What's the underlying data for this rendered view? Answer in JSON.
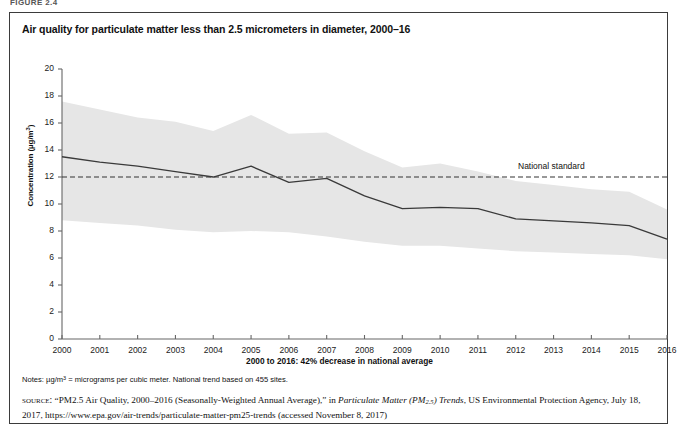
{
  "figure": {
    "label": "FIGURE 2.4",
    "title": "Air quality for particulate matter less than 2.5 micrometers in diameter, 2000–16"
  },
  "notes": {
    "text": "Notes: µg/m³ = micrograms per cubic meter. National trend based on 455 sites."
  },
  "source": {
    "kicker": "source:",
    "part1": "“PM2.5 Air Quality, 2000–2016 (Seasonally-Weighted Annual Average),” in ",
    "italic_title_a": "Particulate Matter (PM",
    "italic_title_sub": "2.5",
    "italic_title_b": ") Trends",
    "part2": ", US Environmental Protection Agency, July 18, 2017, https://www.epa.gov/air-trends/particulate-matter-pm25-trends (accessed November 8, 2017)"
  },
  "chart_data": {
    "type": "line",
    "title": "Air quality for particulate matter less than 2.5 micrometers in diameter, 2000–16",
    "xlabel": "2000 to 2016: 42% decrease in national average",
    "ylabel": "Concentration (µg/m³)",
    "ylim": [
      0,
      20
    ],
    "ytick_step": 2,
    "yticks": [
      0,
      2,
      4,
      6,
      8,
      10,
      12,
      14,
      16,
      18,
      20
    ],
    "x": [
      2000,
      2001,
      2002,
      2003,
      2004,
      2005,
      2006,
      2007,
      2008,
      2009,
      2010,
      2011,
      2012,
      2013,
      2014,
      2015,
      2016
    ],
    "xtick_labels": [
      "2000",
      "2001",
      "2002",
      "2003",
      "2004",
      "2005",
      "2006",
      "2007",
      "2008",
      "2009",
      "2010",
      "2011",
      "2012",
      "2013",
      "2014",
      "2015",
      "2016"
    ],
    "grid": false,
    "legend": "none",
    "series": [
      {
        "name": "National average",
        "style": "solid-line",
        "color": "#3a3a3a",
        "values": [
          13.5,
          13.1,
          12.8,
          12.4,
          12.0,
          12.8,
          11.6,
          11.9,
          10.6,
          9.65,
          9.75,
          9.65,
          8.9,
          8.75,
          8.6,
          8.4,
          7.4
        ]
      },
      {
        "name": "National standard",
        "style": "dashed-line",
        "color": "#333333",
        "constant_value": 12,
        "annotation": "National standard"
      },
      {
        "name": "90% range of site concentrations",
        "style": "shaded-band",
        "color": "#e6e6e6",
        "upper": [
          17.6,
          17.0,
          16.4,
          16.1,
          15.4,
          16.6,
          15.2,
          15.3,
          13.9,
          12.7,
          13.0,
          12.4,
          11.7,
          11.4,
          11.1,
          10.9,
          9.6
        ],
        "lower": [
          8.8,
          8.6,
          8.4,
          8.1,
          7.9,
          8.0,
          7.9,
          7.6,
          7.2,
          6.9,
          6.9,
          6.7,
          6.5,
          6.4,
          6.3,
          6.2,
          5.9
        ]
      }
    ]
  }
}
